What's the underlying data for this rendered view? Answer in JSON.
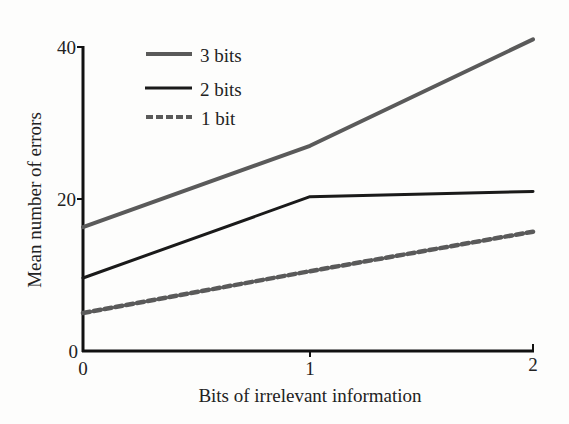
{
  "chart_data": {
    "type": "line",
    "title": "",
    "xlabel": "Bits of irrelevant information",
    "ylabel": "Mean number of errors",
    "x": [
      0,
      1,
      2
    ],
    "x_ticks": [
      "0",
      "1",
      "2"
    ],
    "y_ticks": [
      "0",
      "20",
      "40"
    ],
    "xlim": [
      0,
      2
    ],
    "ylim": [
      0,
      40
    ],
    "grid": false,
    "legend_position": "upper-left",
    "series": [
      {
        "name": "3 bits",
        "values": [
          16.3,
          27,
          41
        ],
        "color": "#5a5a5a",
        "style": "solid"
      },
      {
        "name": "2 bits",
        "values": [
          9.6,
          20.3,
          21
        ],
        "color": "#1a1a1a",
        "style": "solid"
      },
      {
        "name": "1 bit",
        "values": [
          5,
          10.5,
          15.7
        ],
        "color": "#5a5a5a",
        "style": "dashed"
      }
    ]
  }
}
